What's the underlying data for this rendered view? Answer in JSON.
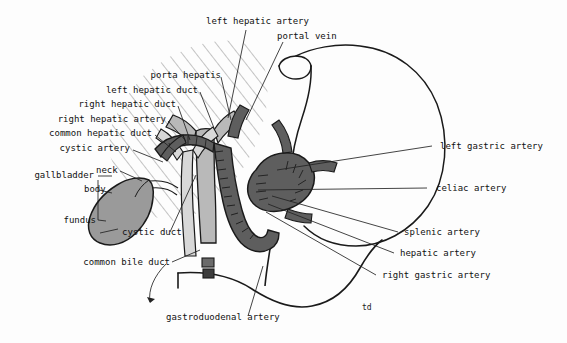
{
  "figure": {
    "signature": "td",
    "background_color": "#fdfdfd",
    "ink_color": "#111111",
    "leader_color": "#222222",
    "hatch_color": "#8d8d8d",
    "fill_light": "#b9b9b9",
    "fill_mid": "#9a9a9a",
    "fill_dark": "#5e5e5e",
    "fill_darkest": "#3d3d3d"
  },
  "labels": {
    "top": [
      {
        "id": "left-hepatic-artery",
        "text": "left hepatic artery"
      },
      {
        "id": "portal-vein",
        "text": "portal vein"
      }
    ],
    "left": [
      {
        "id": "porta-hepatis",
        "text": "porta hepatis"
      },
      {
        "id": "left-hepatic-duct",
        "text": "left hepatic duct"
      },
      {
        "id": "right-hepatic-duct",
        "text": "right hepatic duct"
      },
      {
        "id": "right-hepatic-artery",
        "text": "right hepatic artery"
      },
      {
        "id": "common-hepatic-duct",
        "text": "common hepatic duct"
      },
      {
        "id": "cystic-artery",
        "text": "cystic artery"
      },
      {
        "id": "gallbladder",
        "text": "gallbladder"
      },
      {
        "id": "neck",
        "text": "neck"
      },
      {
        "id": "body",
        "text": "body"
      },
      {
        "id": "fundus",
        "text": "fundus"
      },
      {
        "id": "cystic-duct",
        "text": "cystic duct"
      },
      {
        "id": "common-bile-duct",
        "text": "common bile duct"
      }
    ],
    "right": [
      {
        "id": "left-gastric-artery",
        "text": "left gastric artery"
      },
      {
        "id": "celiac-artery",
        "text": "celiac artery"
      },
      {
        "id": "splenic-artery",
        "text": "splenic artery"
      },
      {
        "id": "hepatic-artery",
        "text": "hepatic artery"
      },
      {
        "id": "right-gastric-artery",
        "text": "right gastric artery"
      }
    ],
    "bottom": [
      {
        "id": "gastroduodenal-artery",
        "text": "gastroduodenal artery"
      }
    ]
  }
}
